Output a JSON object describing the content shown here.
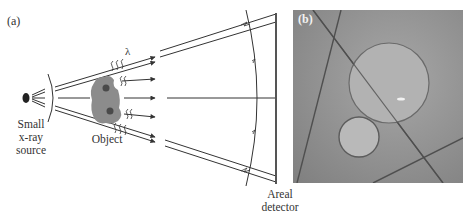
{
  "figure": {
    "panel_a": {
      "label": "(a)",
      "source_label_lines": [
        "Small",
        "x-ray",
        "source"
      ],
      "object_label": "Object",
      "wavelength_symbol": "λ",
      "detector_label_lines": [
        "Areal",
        "detector"
      ]
    },
    "panel_b": {
      "label": "(b)"
    },
    "colors": {
      "line": "#333333",
      "object_fill": "#8c8c8c",
      "object_inclusion": "#4a4a4a",
      "photo_bg": "#8f8f8f",
      "sphere_fill": "#b4b4b4",
      "fiber": "#4f4f4f"
    }
  }
}
